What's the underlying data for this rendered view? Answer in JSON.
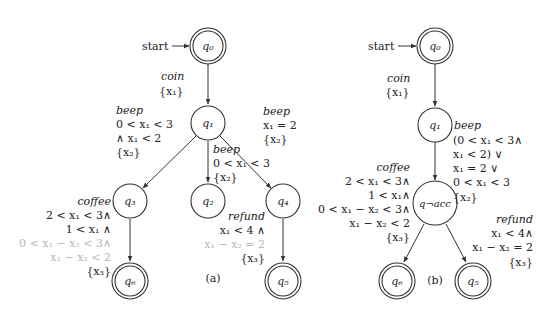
{
  "panel_a": {
    "caption": "(a)",
    "start_label": "start",
    "states": {
      "q0": "q₀",
      "q1": "q₁",
      "q2": "q₂",
      "q3": "q₃",
      "q4": "q₄",
      "q5": "q₅",
      "q6": "q₆"
    },
    "edges": {
      "q0_q1": {
        "action": "coin",
        "reset": "{x₁}"
      },
      "q1_q3": {
        "action": "beep",
        "guard1": "0 < x₁ < 3",
        "guard2": "∧ x₁ < 2",
        "reset": "{x₂}"
      },
      "q1_q2": {
        "action": "beep",
        "guard1": "0 < x₁ < 3",
        "reset": "{x₂}"
      },
      "q1_q4": {
        "action": "beep",
        "guard1": "x₁ = 2",
        "reset": "{x₂}"
      },
      "q3_q6": {
        "action": "coffee",
        "guard1": "2 < x₁ < 3∧",
        "guard2": "1 < x₁ ∧",
        "guard3": "0 < x₁ − x₂ < 3∧",
        "guard4": "x₁ − x₂ < 2",
        "reset": "{x₃}"
      },
      "q4_q5": {
        "action": "refund",
        "guard1": "x₁ < 4 ∧",
        "guard2": "x₁ − x₂ = 2",
        "reset": "{x₃}"
      }
    }
  },
  "panel_b": {
    "caption": "(b)",
    "start_label": "start",
    "states": {
      "q0": "q₀",
      "q1": "q₁",
      "qnacc": "q¬acc",
      "q5": "q₅",
      "q6": "q₆"
    },
    "edges": {
      "q0_q1": {
        "action": "coin",
        "reset": "{x₁}"
      },
      "q1_qnacc": {
        "action": "beep",
        "guard1": "(0 < x₁ < 3∧",
        "guard2": "x₁ < 2) ∨",
        "guard3": "x₁ = 2 ∨",
        "guard4": "0 < x₁ < 3",
        "reset": "{x₂}"
      },
      "qnacc_q6": {
        "action": "coffee",
        "guard1": "2 < x₁ < 3∧",
        "guard2": "1 < x₁∧",
        "guard3": "0 < x₁ − x₂ < 3∧",
        "guard4": "x₁ − x₂ < 2",
        "reset": "{x₃}"
      },
      "qnacc_q5": {
        "action": "refund",
        "guard1": "x₁ < 4∧",
        "guard2": "x₁ − x₂ = 2",
        "reset": "{x₃}"
      }
    }
  }
}
